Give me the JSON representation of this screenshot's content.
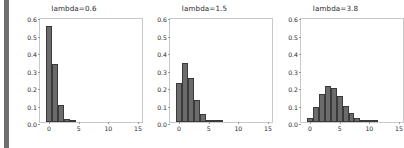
{
  "figure": {
    "width": 401,
    "height": 148,
    "background": "#ffffff",
    "bar_color": "#6b6b6b",
    "bar_edge_color": "#3a3a3a",
    "spine_color": "#c9c9c9",
    "tick_color": "#9a9a9a",
    "text_color": "#2b2b2b",
    "left_strip_color": "#6e6e6e"
  },
  "chart_data": [
    {
      "type": "bar",
      "title": "lambda=0.6",
      "xlabel": "",
      "ylabel": "",
      "xlim": [
        -1.5,
        16.0
      ],
      "ylim": [
        0.0,
        0.6
      ],
      "grid": false,
      "legend": "none",
      "xticks": [
        0,
        5,
        10,
        15
      ],
      "xtick_labels": [
        "0",
        "5",
        "10",
        "15"
      ],
      "yticks": [
        0.0,
        0.1,
        0.2,
        0.3,
        0.4,
        0.5,
        0.6
      ],
      "ytick_labels": [
        "0.0",
        "0.1",
        "0.2",
        "0.3",
        "0.4",
        "0.5",
        "0.6"
      ],
      "bar_width": 1.0,
      "categories": [
        0,
        1,
        2,
        3,
        4,
        5
      ],
      "values": [
        0.549,
        0.329,
        0.099,
        0.02,
        0.003,
        0.0
      ]
    },
    {
      "type": "bar",
      "title": "lambda=1.5",
      "xlabel": "",
      "ylabel": "",
      "xlim": [
        -1.5,
        16.0
      ],
      "ylim": [
        0.0,
        0.6
      ],
      "grid": false,
      "legend": "none",
      "xticks": [
        0,
        5,
        10,
        15
      ],
      "xtick_labels": [
        "0",
        "5",
        "10",
        "15"
      ],
      "yticks": [
        0.0,
        0.1,
        0.2,
        0.3,
        0.4,
        0.5,
        0.6
      ],
      "ytick_labels": [
        "0.0",
        "0.1",
        "0.2",
        "0.3",
        "0.4",
        "0.5",
        "0.6"
      ],
      "bar_width": 1.0,
      "categories": [
        0,
        1,
        2,
        3,
        4,
        5,
        6,
        7
      ],
      "values": [
        0.223,
        0.335,
        0.251,
        0.126,
        0.047,
        0.014,
        0.004,
        0.001
      ]
    },
    {
      "type": "bar",
      "title": "lambda=3.8",
      "xlabel": "",
      "ylabel": "",
      "xlim": [
        -1.5,
        16.0
      ],
      "ylim": [
        0.0,
        0.6
      ],
      "grid": false,
      "legend": "none",
      "xticks": [
        0,
        5,
        10,
        15
      ],
      "xtick_labels": [
        "0",
        "5",
        "10",
        "15"
      ],
      "yticks": [
        0.0,
        0.1,
        0.2,
        0.3,
        0.4,
        0.5,
        0.6
      ],
      "ytick_labels": [
        "0.0",
        "0.1",
        "0.2",
        "0.3",
        "0.4",
        "0.5",
        "0.6"
      ],
      "bar_width": 1.0,
      "categories": [
        0,
        1,
        2,
        3,
        4,
        5,
        6,
        7,
        8,
        9,
        10,
        11,
        12
      ],
      "values": [
        0.022,
        0.085,
        0.161,
        0.205,
        0.194,
        0.148,
        0.094,
        0.051,
        0.024,
        0.01,
        0.004,
        0.001,
        0.0
      ]
    }
  ],
  "panels_geometry": [
    {
      "panel_left": 9,
      "panel_width": 130,
      "axes_left": 30,
      "axes_top": 18,
      "axes_width": 104,
      "axes_height": 105
    },
    {
      "panel_left": 139,
      "panel_width": 131,
      "axes_left": 30,
      "axes_top": 18,
      "axes_width": 104,
      "axes_height": 105
    },
    {
      "panel_left": 270,
      "panel_width": 131,
      "axes_left": 30,
      "axes_top": 18,
      "axes_width": 104,
      "axes_height": 105
    }
  ]
}
